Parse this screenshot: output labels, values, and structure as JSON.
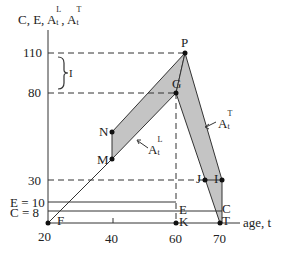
{
  "diagram": {
    "y_axis_label": {
      "main": "C, E, A",
      "sub_L": "t",
      "sup_L": "L",
      "comma": ", A",
      "sub_T": "t",
      "sup_T": "T"
    },
    "x_axis_label": "age, t",
    "y_ticks": [
      {
        "label": "110",
        "value": 110
      },
      {
        "label": "80",
        "value": 80
      },
      {
        "label": "30",
        "value": 30
      },
      {
        "label": "E = 10",
        "value": 10
      },
      {
        "label": "C = 8",
        "value": 8
      }
    ],
    "x_ticks": [
      {
        "label": "20",
        "value": 20
      },
      {
        "label": "40",
        "value": 40
      },
      {
        "label": "60",
        "value": 60
      },
      {
        "label": "70",
        "value": 70
      }
    ],
    "brace_label": "I",
    "points": {
      "P": "P",
      "G": "G",
      "N": "N",
      "M": "M",
      "J": "J",
      "I": "I",
      "C": "C",
      "T": "T",
      "E": "E",
      "K": "K",
      "F": "F"
    },
    "area_labels": {
      "left": {
        "base": "A",
        "sup": "L",
        "sub": "t"
      },
      "right": {
        "base": "A",
        "sup": "T",
        "sub": "t"
      }
    },
    "colors": {
      "shade": "#c4c4c4",
      "line": "#333333"
    }
  }
}
